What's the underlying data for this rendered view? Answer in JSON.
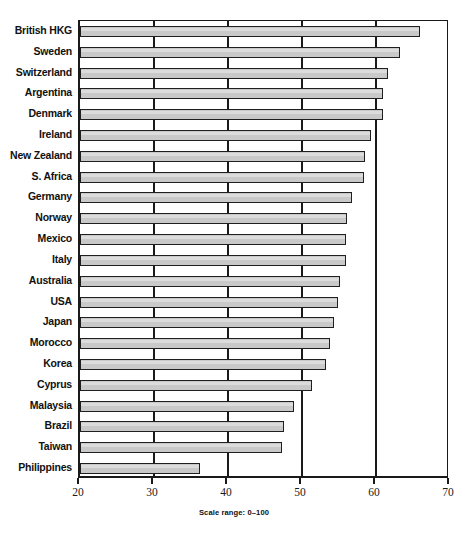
{
  "chart_data": {
    "type": "bar",
    "orientation": "horizontal",
    "title": "",
    "xlabel": "",
    "ylabel": "",
    "xlim": [
      20,
      70
    ],
    "xticks": [
      20,
      30,
      40,
      50,
      60,
      70
    ],
    "gridlines": [
      30,
      40,
      50,
      60
    ],
    "grid": true,
    "legend": null,
    "note": "Scale range: 0–100",
    "categories": [
      "British HKG",
      "Sweden",
      "Switzerland",
      "Argentina",
      "Denmark",
      "Ireland",
      "New Zealand",
      "S. Africa",
      "Germany",
      "Norway",
      "Mexico",
      "Italy",
      "Australia",
      "USA",
      "Japan",
      "Morocco",
      "Korea",
      "Cyprus",
      "Malaysia",
      "Brazil",
      "Taiwan",
      "Philippines"
    ],
    "values": [
      66.0,
      63.2,
      61.6,
      61.0,
      61.0,
      59.3,
      58.5,
      58.4,
      56.7,
      56.1,
      56.0,
      56.0,
      55.2,
      54.9,
      54.3,
      53.8,
      53.3,
      51.3,
      48.9,
      47.5,
      47.3,
      36.2
    ]
  },
  "colors": {
    "bar_fill": "#c9c9c9",
    "bar_border": "#1f1f1f",
    "axis": "#1a1a1a",
    "background": "#ffffff"
  },
  "footer": {
    "scale_note": "Scale range: 0–100"
  }
}
